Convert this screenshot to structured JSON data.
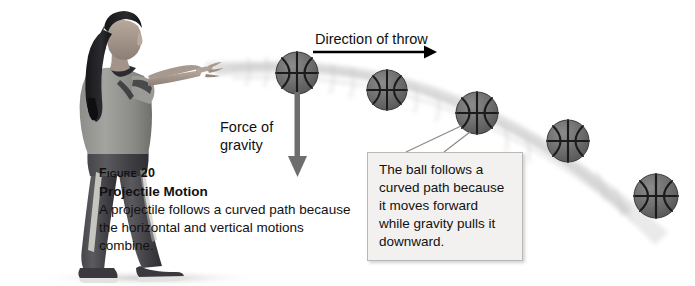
{
  "figure": {
    "direction_label": "Direction of throw",
    "gravity_label": "Force of gravity",
    "caption": {
      "figure_number": "Figure 20",
      "title": "Projectile Motion",
      "body": "A projectile follows a curved path because the horizontal and vertical motions combine."
    },
    "callout": {
      "text": "The ball follows a curved path because it moves forward while gravity pulls it downward."
    },
    "colors": {
      "background": "#ffffff",
      "text": "#111111",
      "callout_fill": "#f2f1ef",
      "callout_border": "#b9b8b6",
      "arrow_direction": "#000000",
      "arrow_gravity": "#6e6e6e",
      "ball_fill": "#6e6e6e",
      "ball_seam": "#1b1b1b",
      "trail": "#e4e4e4"
    },
    "balls": [
      {
        "cx": 297,
        "cy": 73,
        "r": 21
      },
      {
        "cx": 387,
        "cy": 90,
        "r": 20
      },
      {
        "cx": 477,
        "cy": 113,
        "r": 21
      },
      {
        "cx": 568,
        "cy": 141,
        "r": 21
      },
      {
        "cx": 656,
        "cy": 196,
        "r": 22
      }
    ],
    "direction_arrow": {
      "x1": 313,
      "y1": 52,
      "x2": 432,
      "y2": 52
    },
    "gravity_arrow": {
      "x": 297,
      "y1": 92,
      "y2": 176
    }
  }
}
